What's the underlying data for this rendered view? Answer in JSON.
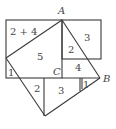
{
  "diagram": {
    "points": {
      "A": {
        "label": "A",
        "x": 62,
        "y": 21
      },
      "B": {
        "label": "B",
        "x": 100,
        "y": 78
      },
      "C": {
        "label": "C",
        "x": 62,
        "y": 78
      }
    },
    "region_labels": [
      {
        "id": "r1",
        "text": "2 + 4",
        "x": 10,
        "y": 35
      },
      {
        "id": "r2",
        "text": "3",
        "x": 84,
        "y": 41
      },
      {
        "id": "r3",
        "text": "5",
        "x": 37,
        "y": 60
      },
      {
        "id": "r4",
        "text": "2",
        "x": 68,
        "y": 53
      },
      {
        "id": "r5",
        "text": "4",
        "x": 75,
        "y": 71
      },
      {
        "id": "r6",
        "text": "1",
        "x": 6,
        "y": 76
      },
      {
        "id": "r7",
        "text": "2",
        "x": 34,
        "y": 92
      },
      {
        "id": "r8",
        "text": "3",
        "x": 58,
        "y": 94
      },
      {
        "id": "r9",
        "text": "1",
        "x": 82,
        "y": 87
      }
    ],
    "colors": {
      "line": "#3a3a3a",
      "text": "#444444",
      "background": "#ffffff"
    }
  }
}
